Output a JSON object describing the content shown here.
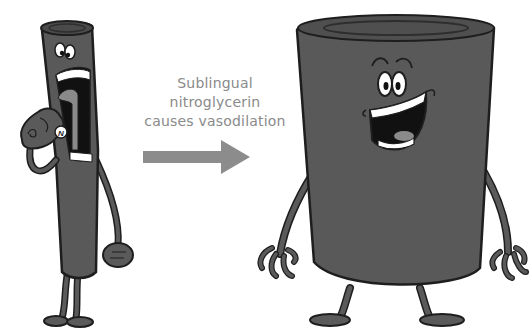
{
  "caption": {
    "lines": [
      "Sublingual",
      "nitroglycerin",
      "causes vasodilation"
    ]
  },
  "pill": {
    "label": "N"
  },
  "colors": {
    "vessel_body": "#595959",
    "vessel_dark": "#3a3a3a",
    "outline": "#1e1e1e",
    "arrow": "#8c8c8c",
    "text": "#8a8a8a",
    "mouth_inner": "#111111",
    "tongue": "#8a8a8a",
    "teeth": "#ffffff"
  },
  "figures": [
    {
      "name": "narrow-vessel",
      "state": "constricted"
    },
    {
      "name": "wide-vessel",
      "state": "dilated"
    }
  ]
}
